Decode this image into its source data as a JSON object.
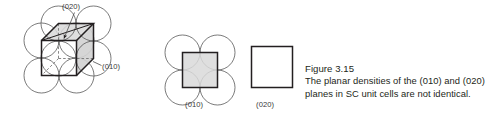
{
  "figure": {
    "id": "figure-3-15",
    "caption_title": "Figure 3.15",
    "caption_line_1": "The planar densities of the (010) and (020)",
    "caption_line_2": "planes in SC unit cells are not identical.",
    "labels": {
      "top_plane": "(020)",
      "side_plane": "(010)",
      "middle_plane": "(010)",
      "right_plane": "(020)"
    },
    "colors": {
      "outline": "#231f20",
      "circle_stroke": "#4d4d4d",
      "shade_fill": "#d9d9d9",
      "shade_fill_dark": "#c9c9c9",
      "leader_line": "#4d4d4d",
      "background": "#ffffff",
      "text": "#231f20"
    },
    "panels": [
      {
        "name": "sc-unit-cell-3d",
        "description": "Simple cubic unit cell drawn in oblique projection with corner atoms shown as circles; the (010) back face and the (020) mid-plane are shaded."
      },
      {
        "name": "plane-010-atoms",
        "description": "(010) plane cross-section showing four quarter atoms at the square corners."
      },
      {
        "name": "plane-020-empty",
        "description": "(020) plane cross-section containing no atom centers."
      }
    ]
  }
}
